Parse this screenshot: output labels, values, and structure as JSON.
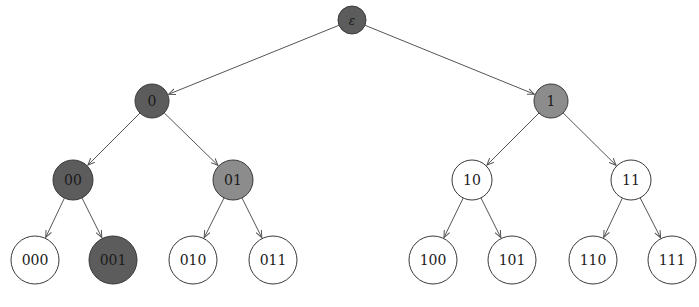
{
  "diagram": {
    "type": "binary-tree",
    "colors": {
      "dark": "#5c5c5c",
      "medium": "#8c8c8c",
      "white": "#ffffff",
      "stroke": "#3a3a3a",
      "edge": "#555555"
    },
    "nodes": [
      {
        "id": "root",
        "label": "ε",
        "x": 352,
        "y": 20,
        "r": 14,
        "fill": "dark"
      },
      {
        "id": "0",
        "label": "0",
        "x": 152,
        "y": 101,
        "r": 17,
        "fill": "dark"
      },
      {
        "id": "1",
        "label": "1",
        "x": 551,
        "y": 101,
        "r": 17,
        "fill": "medium"
      },
      {
        "id": "00",
        "label": "00",
        "x": 73,
        "y": 180,
        "r": 20,
        "fill": "dark"
      },
      {
        "id": "01",
        "label": "01",
        "x": 233,
        "y": 180,
        "r": 20,
        "fill": "medium"
      },
      {
        "id": "10",
        "label": "10",
        "x": 472,
        "y": 180,
        "r": 20,
        "fill": "white"
      },
      {
        "id": "11",
        "label": "11",
        "x": 631,
        "y": 180,
        "r": 20,
        "fill": "white"
      },
      {
        "id": "000",
        "label": "000",
        "x": 35,
        "y": 260,
        "r": 24,
        "fill": "white"
      },
      {
        "id": "001",
        "label": "001",
        "x": 113,
        "y": 260,
        "r": 24,
        "fill": "dark"
      },
      {
        "id": "010",
        "label": "010",
        "x": 193,
        "y": 260,
        "r": 24,
        "fill": "white"
      },
      {
        "id": "011",
        "label": "011",
        "x": 273,
        "y": 260,
        "r": 24,
        "fill": "white"
      },
      {
        "id": "100",
        "label": "100",
        "x": 433,
        "y": 260,
        "r": 24,
        "fill": "white"
      },
      {
        "id": "101",
        "label": "101",
        "x": 512,
        "y": 260,
        "r": 24,
        "fill": "white"
      },
      {
        "id": "110",
        "label": "110",
        "x": 593,
        "y": 260,
        "r": 24,
        "fill": "white"
      },
      {
        "id": "111",
        "label": "111",
        "x": 672,
        "y": 260,
        "r": 24,
        "fill": "white"
      }
    ],
    "edges": [
      [
        "root",
        "0"
      ],
      [
        "root",
        "1"
      ],
      [
        "0",
        "00"
      ],
      [
        "0",
        "01"
      ],
      [
        "1",
        "10"
      ],
      [
        "1",
        "11"
      ],
      [
        "00",
        "000"
      ],
      [
        "00",
        "001"
      ],
      [
        "01",
        "010"
      ],
      [
        "01",
        "011"
      ],
      [
        "10",
        "100"
      ],
      [
        "10",
        "101"
      ],
      [
        "11",
        "110"
      ],
      [
        "11",
        "111"
      ]
    ]
  }
}
